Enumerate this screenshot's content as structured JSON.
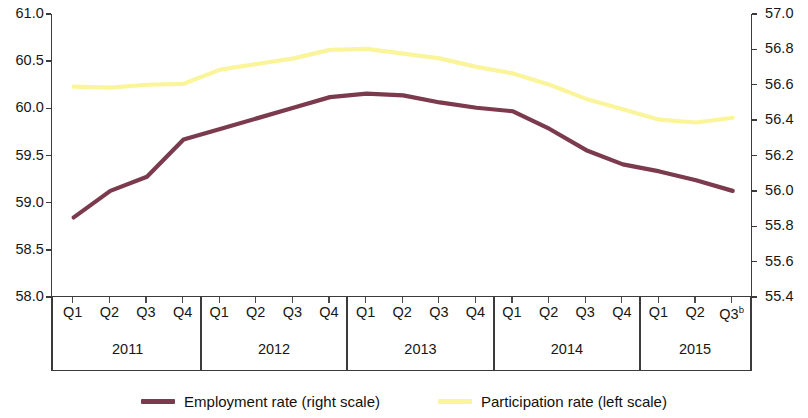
{
  "chart_data": {
    "type": "line",
    "title": "",
    "subtitle": "",
    "xlabel": "",
    "grid": false,
    "legend_position": "bottom-center",
    "x": [
      "Q1",
      "Q2",
      "Q3",
      "Q4",
      "Q1",
      "Q2",
      "Q3",
      "Q4",
      "Q1",
      "Q2",
      "Q3",
      "Q4",
      "Q1",
      "Q2",
      "Q3",
      "Q4",
      "Q1",
      "Q2",
      "Q3"
    ],
    "x_groups": [
      {
        "label": "2011",
        "quarters": [
          "Q1",
          "Q2",
          "Q3",
          "Q4"
        ]
      },
      {
        "label": "2012",
        "quarters": [
          "Q1",
          "Q2",
          "Q3",
          "Q4"
        ]
      },
      {
        "label": "2013",
        "quarters": [
          "Q1",
          "Q2",
          "Q3",
          "Q4"
        ]
      },
      {
        "label": "2014",
        "quarters": [
          "Q1",
          "Q2",
          "Q3",
          "Q4"
        ]
      },
      {
        "label": "2015",
        "quarters": [
          "Q1",
          "Q2",
          "Q3"
        ]
      }
    ],
    "x_last_label_footnote": "b",
    "left_axis": {
      "label": "Participation rate (left scale)",
      "ylim": [
        58.0,
        61.0
      ],
      "tick_step": 0.5,
      "ticks": [
        "58.0",
        "58.5",
        "59.0",
        "59.5",
        "60.0",
        "60.5",
        "61.0"
      ],
      "tick_values": [
        58.0,
        58.5,
        59.0,
        59.5,
        60.0,
        60.5,
        61.0
      ]
    },
    "right_axis": {
      "label": "Employment rate (right scale)",
      "ylim": [
        55.4,
        57.0
      ],
      "tick_step": 0.2,
      "ticks": [
        "55.4",
        "55.6",
        "55.8",
        "56.0",
        "56.2",
        "56.4",
        "56.6",
        "56.8",
        "57.0"
      ],
      "tick_values": [
        55.4,
        55.6,
        55.8,
        56.0,
        56.2,
        56.4,
        56.6,
        56.8,
        57.0
      ]
    },
    "series": [
      {
        "name": "Participation rate (left scale)",
        "axis": "left",
        "color": "#FAF59B",
        "values": [
          60.23,
          60.22,
          60.25,
          60.26,
          60.41,
          60.47,
          60.53,
          60.62,
          60.63,
          60.58,
          60.53,
          60.44,
          60.37,
          60.25,
          60.1,
          59.99,
          59.88,
          59.85,
          59.9
        ]
      },
      {
        "name": "Employment rate (right scale)",
        "axis": "right",
        "color": "#7B3A4E",
        "values": [
          55.85,
          56.0,
          56.08,
          56.29,
          56.35,
          56.41,
          56.47,
          56.53,
          56.55,
          56.54,
          56.5,
          56.47,
          56.45,
          56.35,
          56.23,
          56.15,
          56.11,
          56.06,
          56.0
        ]
      }
    ],
    "participation_left_scale_values": [
      60.23,
      60.22,
      60.25,
      60.26,
      60.41,
      60.47,
      60.53,
      60.62,
      60.63,
      60.58,
      60.53,
      60.44,
      60.37,
      60.25,
      60.1,
      59.99,
      59.88,
      59.85,
      59.9
    ],
    "employment_right_scale_values": [
      55.85,
      56.0,
      56.08,
      56.29,
      56.35,
      56.41,
      56.47,
      56.53,
      56.55,
      56.54,
      56.5,
      56.47,
      56.45,
      56.35,
      56.23,
      56.15,
      56.11,
      56.06,
      56.0
    ]
  },
  "legend": {
    "items": [
      {
        "label": "Employment rate (right scale)",
        "color": "#7B3A4E"
      },
      {
        "label": "Participation rate (left scale)",
        "color": "#FAF59B"
      }
    ]
  },
  "colors": {
    "employment_line": "#7B3A4E",
    "participation_line": "#FAF59B",
    "axis": "#3b3b3b",
    "text": "#161616",
    "background": "#ffffff"
  }
}
